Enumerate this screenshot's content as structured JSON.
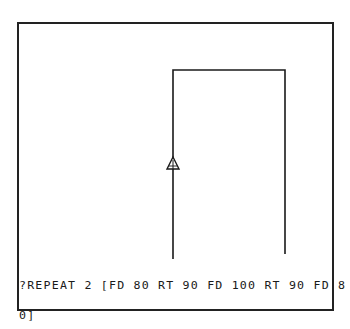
{
  "screen": {
    "type": "logo-turtle-graphics",
    "frame_color": "#222222",
    "background_color": "#ffffff",
    "ink_color": "#1a1a1a"
  },
  "drawing": {
    "path": [
      {
        "x": 173,
        "y": 259
      },
      {
        "x": 173,
        "y": 70
      },
      {
        "x": 285,
        "y": 70
      },
      {
        "x": 285,
        "y": 254
      }
    ],
    "turtle": {
      "x": 173,
      "y": 163,
      "heading": "up",
      "icon": "turtle-triangle-icon"
    }
  },
  "console": {
    "lines": [
      "?REPEAT 2 [FD 80 RT 90 FD 100 RT 90 FD 8",
      "0]"
    ]
  }
}
